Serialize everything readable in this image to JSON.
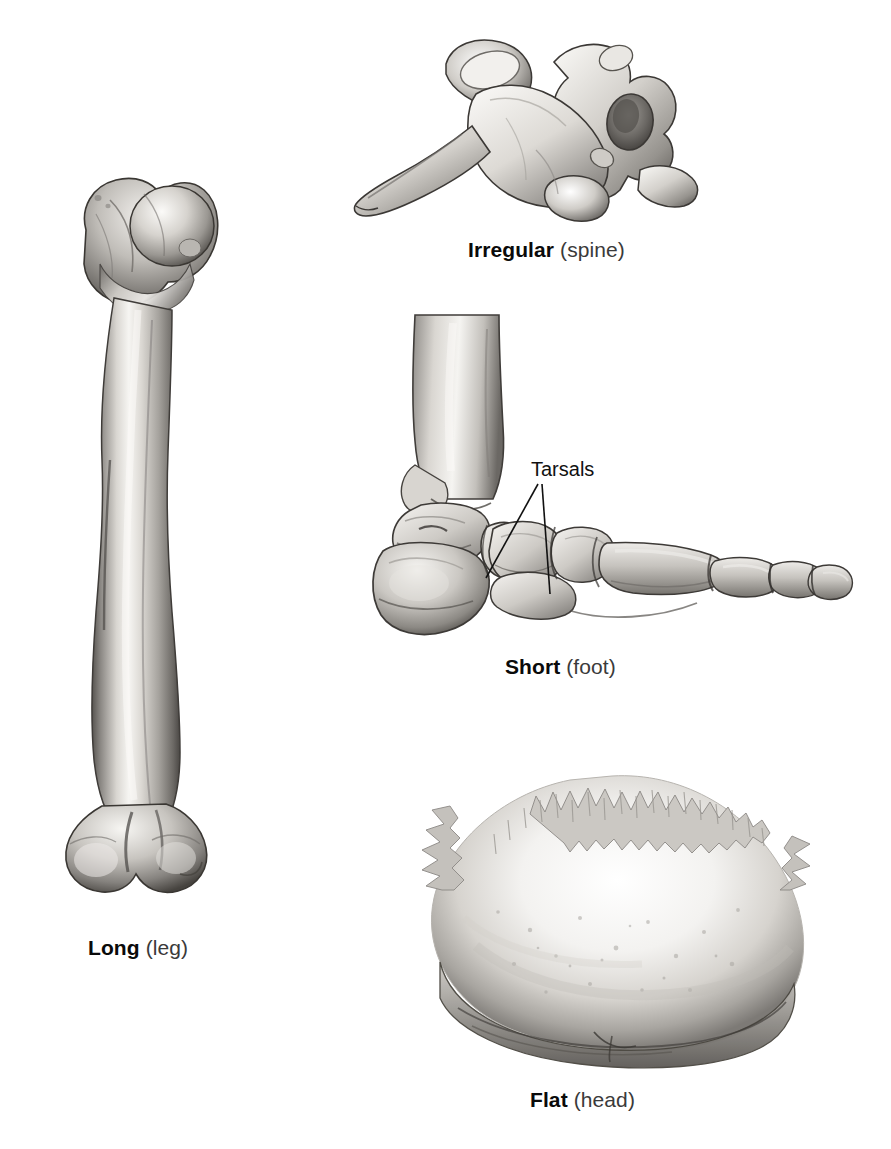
{
  "figure": {
    "background_color": "#ffffff",
    "ink_color": "#111111"
  },
  "panels": [
    {
      "id": "long",
      "kind": "Long",
      "region": "(leg)",
      "caption_kind": "Long",
      "caption_region": "(leg)",
      "specimen": "femur",
      "view": "anterior whole bone",
      "caption_center_x": 142,
      "caption_y": 950
    },
    {
      "id": "irregular",
      "kind": "Irregular",
      "region": "(spine)",
      "caption_kind": "Irregular",
      "caption_region": "(spine)",
      "specimen": "thoracic vertebra",
      "view": "lateral oblique",
      "caption_center_x": 559,
      "caption_y": 242
    },
    {
      "id": "short",
      "kind": "Short",
      "region": "(foot)",
      "caption_kind": "Short",
      "caption_region": "(foot)",
      "specimen": "foot skeleton",
      "view": "lateral",
      "caption_center_x": 567,
      "caption_y": 659
    },
    {
      "id": "flat",
      "kind": "Flat",
      "region": "(head)",
      "caption_kind": "Flat",
      "caption_region": "(head)",
      "specimen": "cranial vault bone",
      "view": "external surface",
      "caption_center_x": 590,
      "caption_y": 1098
    }
  ],
  "callouts": [
    {
      "id": "tarsals",
      "label": "Tarsals",
      "panel": "short",
      "label_x": 531,
      "label_y": 474,
      "leader_count": 2
    }
  ],
  "palette": {
    "bone_light": "#f4f2ef",
    "bone_mid": "#c9c6c1",
    "bone_shadow": "#8e8b86",
    "bone_dark": "#55524e",
    "outline": "#2e2c29",
    "text": "#111111",
    "text_muted": "#3a3a3a"
  }
}
